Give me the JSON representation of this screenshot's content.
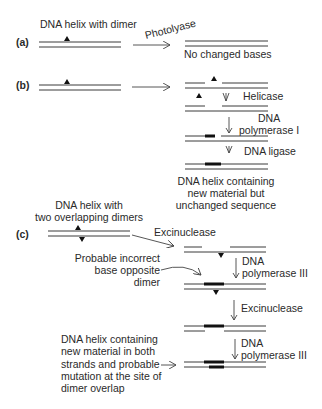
{
  "figure": {
    "panels": {
      "a": {
        "label": "(a)",
        "input_caption": "DNA helix with dimer",
        "enzyme": "Photolyase",
        "result_caption": "No changed bases"
      },
      "b": {
        "label": "(b)",
        "steps": [
          "Helicase",
          "DNA",
          "polymerase I",
          "DNA ligase"
        ],
        "result_caption": [
          "DNA helix containing",
          "new material but",
          "unchanged sequence"
        ]
      },
      "c": {
        "label": "(c)",
        "input_caption": [
          "DNA helix with",
          "two overlapping dimers"
        ],
        "enzyme": "Excinuclease",
        "note": [
          "Probable incorrect",
          "base opposite",
          "dimer"
        ],
        "steps": [
          "DNA",
          "polymerase III",
          "Excinuclease",
          "DNA",
          "polymerase III"
        ],
        "result_caption": [
          "DNA helix containing",
          "new material in both",
          "strands and probable",
          "mutation at the site of",
          "dimer overlap"
        ]
      }
    },
    "colors": {
      "strand": "#3a3a3a",
      "new_material": "#111111",
      "text": "#2a2a2a"
    }
  }
}
